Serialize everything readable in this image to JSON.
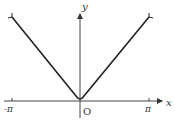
{
  "figure": {
    "type": "function graph",
    "function": "y = |x| style V-shaped curve on [-π, π]",
    "axes": {
      "x_label": "x",
      "y_label": "y",
      "origin_label": "O",
      "x_ticks": [
        "-π",
        "π"
      ]
    },
    "colors": {
      "curve": "#222222",
      "axis": "#444444"
    }
  }
}
